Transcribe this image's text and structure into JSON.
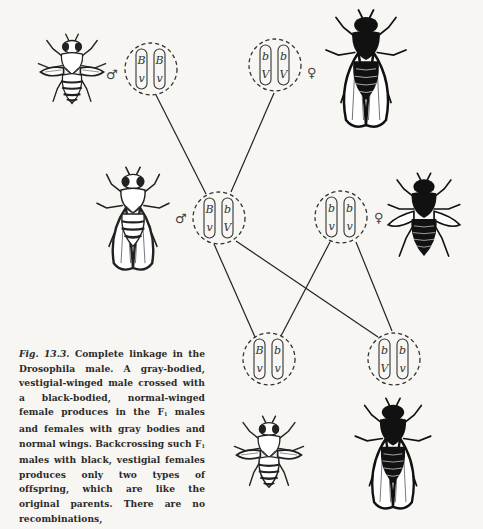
{
  "figure": {
    "number": "Fig. 13.3.",
    "caption_parts": {
      "p1": " Complete linkage in the Drosophila male. A gray-bodied, vestigial-winged male crossed with a black-bodied, normal-winged female produces in the F",
      "sub1": "1",
      "p2": " males and females with gray bodies and normal wings. Backcrossing such F",
      "sub2": "1",
      "p3": " males with black, vestigial females produces only two types of offspring, which are like the original parents. There are no recombinations,"
    },
    "symbols": {
      "male": "♂",
      "female": "♀"
    },
    "genotypes": {
      "parent_male": {
        "chromosomes": [
          [
            "B",
            "v"
          ],
          [
            "B",
            "v"
          ]
        ],
        "sex": "male",
        "phenotype": "gray body, vestigial wings"
      },
      "parent_female": {
        "chromosomes": [
          [
            "b",
            "V"
          ],
          [
            "b",
            "V"
          ]
        ],
        "sex": "female",
        "phenotype": "black body, normal wings"
      },
      "f1_male": {
        "chromosomes": [
          [
            "B",
            "v"
          ],
          [
            "b",
            "V"
          ]
        ],
        "sex": "male",
        "phenotype": "gray body, normal wings"
      },
      "backcross_female": {
        "chromosomes": [
          [
            "b",
            "v"
          ],
          [
            "b",
            "v"
          ]
        ],
        "sex": "female",
        "phenotype": "black body, vestigial wings"
      },
      "offspring_left": {
        "chromosomes": [
          [
            "B",
            "v"
          ],
          [
            "b",
            "v"
          ]
        ],
        "phenotype": "gray body, vestigial wings"
      },
      "offspring_right": {
        "chromosomes": [
          [
            "b",
            "V"
          ],
          [
            "b",
            "v"
          ]
        ],
        "phenotype": "black body, normal wings"
      }
    },
    "colors": {
      "ink": "#1e1e1e",
      "paper": "#f7f6f2"
    }
  }
}
